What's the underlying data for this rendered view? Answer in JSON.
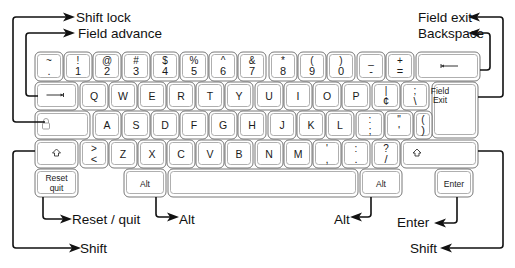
{
  "colors": {
    "key_border": "#6a6a6a",
    "key_inner_border": "#9a9a9a",
    "key_fill": "#ffffff",
    "line": "#111111",
    "text": "#1a1a1a"
  },
  "keys": [
    {
      "id": "tilde",
      "x": 35,
      "y": 52,
      "w": 28,
      "h": 29,
      "top": "~",
      "bottom": "."
    },
    {
      "id": "1",
      "x": 64,
      "y": 52,
      "w": 28,
      "h": 29,
      "top": "!",
      "bottom": "1"
    },
    {
      "id": "2",
      "x": 93,
      "y": 52,
      "w": 28,
      "h": 29,
      "top": "@",
      "bottom": "2"
    },
    {
      "id": "3",
      "x": 122,
      "y": 52,
      "w": 28,
      "h": 29,
      "top": "#",
      "bottom": "3"
    },
    {
      "id": "4",
      "x": 151,
      "y": 52,
      "w": 28,
      "h": 29,
      "top": "$",
      "bottom": "4"
    },
    {
      "id": "5",
      "x": 180,
      "y": 52,
      "w": 28,
      "h": 29,
      "top": "%",
      "bottom": "5"
    },
    {
      "id": "6",
      "x": 209,
      "y": 52,
      "w": 28,
      "h": 29,
      "top": "^",
      "bottom": "6"
    },
    {
      "id": "7",
      "x": 238,
      "y": 52,
      "w": 28,
      "h": 29,
      "top": "&",
      "bottom": "7"
    },
    {
      "id": "8",
      "x": 269,
      "y": 52,
      "w": 28,
      "h": 29,
      "top": "*",
      "bottom": "8"
    },
    {
      "id": "9",
      "x": 298,
      "y": 52,
      "w": 28,
      "h": 29,
      "top": "(",
      "bottom": "9"
    },
    {
      "id": "0",
      "x": 327,
      "y": 52,
      "w": 28,
      "h": 29,
      "top": ")",
      "bottom": "0"
    },
    {
      "id": "minus",
      "x": 357,
      "y": 52,
      "w": 28,
      "h": 29,
      "top": "_",
      "bottom": "-"
    },
    {
      "id": "equals",
      "x": 386,
      "y": 52,
      "w": 28,
      "h": 29,
      "top": "+",
      "bottom": "="
    },
    {
      "id": "backspace",
      "x": 416,
      "y": 52,
      "w": 64,
      "h": 29,
      "glyph": "backspace-arrow"
    },
    {
      "id": "tab",
      "x": 35,
      "y": 82,
      "w": 43,
      "h": 28,
      "glyph": "tab-arrow"
    },
    {
      "id": "q",
      "x": 80,
      "y": 82,
      "w": 28,
      "h": 28,
      "center": "Q"
    },
    {
      "id": "w",
      "x": 109,
      "y": 82,
      "w": 28,
      "h": 28,
      "center": "W"
    },
    {
      "id": "e",
      "x": 138,
      "y": 82,
      "w": 28,
      "h": 28,
      "center": "E"
    },
    {
      "id": "r",
      "x": 167,
      "y": 82,
      "w": 28,
      "h": 28,
      "center": "R"
    },
    {
      "id": "t",
      "x": 196,
      "y": 82,
      "w": 28,
      "h": 28,
      "center": "T"
    },
    {
      "id": "y",
      "x": 225,
      "y": 82,
      "w": 28,
      "h": 28,
      "center": "Y"
    },
    {
      "id": "u",
      "x": 255,
      "y": 82,
      "w": 28,
      "h": 28,
      "center": "U"
    },
    {
      "id": "i",
      "x": 284,
      "y": 82,
      "w": 28,
      "h": 28,
      "center": "I"
    },
    {
      "id": "o",
      "x": 313,
      "y": 82,
      "w": 28,
      "h": 28,
      "center": "O"
    },
    {
      "id": "p",
      "x": 342,
      "y": 82,
      "w": 28,
      "h": 28,
      "center": "P"
    },
    {
      "id": "cent",
      "x": 372,
      "y": 82,
      "w": 28,
      "h": 28,
      "top": "|",
      "bottom": "¢"
    },
    {
      "id": "backslash",
      "x": 401,
      "y": 82,
      "w": 28,
      "h": 28,
      "top": ";",
      "bottom": "\\"
    },
    {
      "id": "field-exit",
      "x": 432,
      "y": 82,
      "w": 46,
      "h": 56,
      "line1": "Field",
      "line2": "Exit",
      "left_aligned": true
    },
    {
      "id": "lock",
      "x": 35,
      "y": 111,
      "w": 55,
      "h": 28,
      "glyph": "lock"
    },
    {
      "id": "a",
      "x": 93,
      "y": 111,
      "w": 28,
      "h": 28,
      "center": "A"
    },
    {
      "id": "s",
      "x": 122,
      "y": 111,
      "w": 28,
      "h": 28,
      "center": "S"
    },
    {
      "id": "d",
      "x": 151,
      "y": 111,
      "w": 28,
      "h": 28,
      "center": "D"
    },
    {
      "id": "f",
      "x": 180,
      "y": 111,
      "w": 28,
      "h": 28,
      "center": "F"
    },
    {
      "id": "g",
      "x": 209,
      "y": 111,
      "w": 28,
      "h": 28,
      "center": "G"
    },
    {
      "id": "h",
      "x": 238,
      "y": 111,
      "w": 28,
      "h": 28,
      "center": "H"
    },
    {
      "id": "j",
      "x": 268,
      "y": 111,
      "w": 28,
      "h": 28,
      "center": "J"
    },
    {
      "id": "k",
      "x": 297,
      "y": 111,
      "w": 28,
      "h": 28,
      "center": "K"
    },
    {
      "id": "l",
      "x": 326,
      "y": 111,
      "w": 28,
      "h": 28,
      "center": "L"
    },
    {
      "id": "semicolon",
      "x": 356,
      "y": 111,
      "w": 28,
      "h": 28,
      "top": ":",
      "bottom": ";"
    },
    {
      "id": "quote",
      "x": 385,
      "y": 111,
      "w": 28,
      "h": 28,
      "top": "\"",
      "bottom": "'"
    },
    {
      "id": "brace",
      "x": 414,
      "y": 111,
      "w": 18,
      "h": 28,
      "top": "(",
      "bottom": ")"
    },
    {
      "id": "shift-left",
      "x": 35,
      "y": 140,
      "w": 43,
      "h": 28,
      "glyph": "shift-arrow"
    },
    {
      "id": "angle",
      "x": 80,
      "y": 140,
      "w": 28,
      "h": 28,
      "top": ">",
      "bottom": "<"
    },
    {
      "id": "z",
      "x": 109,
      "y": 140,
      "w": 28,
      "h": 28,
      "center": "Z"
    },
    {
      "id": "x",
      "x": 138,
      "y": 140,
      "w": 28,
      "h": 28,
      "center": "X"
    },
    {
      "id": "c",
      "x": 167,
      "y": 140,
      "w": 28,
      "h": 28,
      "center": "C"
    },
    {
      "id": "v",
      "x": 196,
      "y": 140,
      "w": 28,
      "h": 28,
      "center": "V"
    },
    {
      "id": "b",
      "x": 225,
      "y": 140,
      "w": 28,
      "h": 28,
      "center": "B"
    },
    {
      "id": "n",
      "x": 255,
      "y": 140,
      "w": 28,
      "h": 28,
      "center": "N"
    },
    {
      "id": "m",
      "x": 284,
      "y": 140,
      "w": 28,
      "h": 28,
      "center": "M"
    },
    {
      "id": "comma",
      "x": 313,
      "y": 140,
      "w": 28,
      "h": 28,
      "top": "'",
      "bottom": ","
    },
    {
      "id": "period",
      "x": 342,
      "y": 140,
      "w": 28,
      "h": 28,
      "top": ":",
      "bottom": "."
    },
    {
      "id": "slash",
      "x": 372,
      "y": 140,
      "w": 28,
      "h": 28,
      "top": "?",
      "bottom": "/"
    },
    {
      "id": "shift-right",
      "x": 401,
      "y": 140,
      "w": 77,
      "h": 28,
      "glyph": "shift-arrow",
      "glyph_left": true
    },
    {
      "id": "reset",
      "x": 35,
      "y": 169,
      "w": 43,
      "h": 28,
      "line1": "Reset",
      "line2": "quit"
    },
    {
      "id": "alt-left",
      "x": 124,
      "y": 169,
      "w": 42,
      "h": 28,
      "center": "Alt",
      "small": true
    },
    {
      "id": "space",
      "x": 168,
      "y": 169,
      "w": 190,
      "h": 28
    },
    {
      "id": "alt-right",
      "x": 360,
      "y": 169,
      "w": 42,
      "h": 28,
      "center": "Alt",
      "small": true
    },
    {
      "id": "enter",
      "x": 435,
      "y": 169,
      "w": 38,
      "h": 28,
      "center": "Enter",
      "small": true
    }
  ],
  "callouts": [
    {
      "id": "shift-lock",
      "label": "Shift lock",
      "tx": 76,
      "ty": 22,
      "side": "left",
      "points": [
        [
          45,
          122
        ],
        [
          13,
          122
        ],
        [
          13,
          17
        ],
        [
          66,
          17
        ]
      ],
      "arrow_dir": "right"
    },
    {
      "id": "field-advance",
      "label": "Field advance",
      "tx": 78,
      "ty": 38,
      "side": "left",
      "points": [
        [
          38,
          96
        ],
        [
          26,
          96
        ],
        [
          26,
          33
        ],
        [
          66,
          33
        ]
      ],
      "arrow_dir": "right"
    },
    {
      "id": "field-exit",
      "label": "Field exit",
      "tx": 418,
      "ty": 22,
      "side": "right",
      "points": [
        [
          478,
          97
        ],
        [
          503,
          97
        ],
        [
          503,
          17
        ],
        [
          477,
          17
        ]
      ],
      "arrow_dir": "left"
    },
    {
      "id": "backspace",
      "label": "Backspace",
      "tx": 418,
      "ty": 38,
      "side": "right",
      "points": [
        [
          480,
          70
        ],
        [
          490,
          70
        ],
        [
          490,
          33
        ],
        [
          477,
          33
        ]
      ],
      "arrow_dir": "left"
    },
    {
      "id": "reset-quit",
      "label": "Reset / quit",
      "tx": 72,
      "ty": 224,
      "side": "left",
      "points": [
        [
          43,
          197
        ],
        [
          43,
          219
        ],
        [
          63,
          219
        ]
      ],
      "arrow_dir": "right"
    },
    {
      "id": "alt-left",
      "label": "Alt",
      "tx": 179,
      "ty": 224,
      "side": "left",
      "points": [
        [
          156,
          197
        ],
        [
          156,
          217
        ],
        [
          170,
          217
        ]
      ],
      "arrow_dir": "right"
    },
    {
      "id": "shift-left",
      "label": "Shift",
      "tx": 80,
      "ty": 253,
      "side": "left",
      "points": [
        [
          35,
          151
        ],
        [
          13,
          151
        ],
        [
          13,
          248
        ],
        [
          72,
          248
        ]
      ],
      "arrow_dir": "right"
    },
    {
      "id": "alt-right",
      "label": "Alt",
      "tx": 334,
      "ty": 224,
      "side": "right",
      "points": [
        [
          371,
          197
        ],
        [
          371,
          217
        ],
        [
          359,
          217
        ]
      ],
      "arrow_dir": "left"
    },
    {
      "id": "enter",
      "label": "Enter",
      "tx": 397,
      "ty": 227,
      "side": "right",
      "points": [
        [
          457,
          197
        ],
        [
          457,
          223
        ],
        [
          443,
          223
        ]
      ],
      "arrow_dir": "left"
    },
    {
      "id": "shift-right",
      "label": "Shift",
      "tx": 410,
      "ty": 253,
      "side": "right",
      "points": [
        [
          478,
          151
        ],
        [
          503,
          151
        ],
        [
          503,
          248
        ],
        [
          449,
          248
        ]
      ],
      "arrow_dir": "left"
    }
  ]
}
